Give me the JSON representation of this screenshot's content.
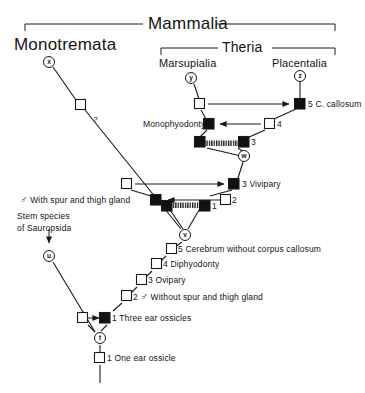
{
  "figure": {
    "type": "cladogram"
  },
  "brackets": [
    {
      "name": "mammalia",
      "label": "Mammalia"
    },
    {
      "name": "theria",
      "label": "Theria"
    }
  ],
  "taxa": [
    {
      "name": "monotremata",
      "label": "Monotremata",
      "node_letter": "x"
    },
    {
      "name": "marsupialia",
      "label": "Marsupialia",
      "node_letter": "y"
    },
    {
      "name": "placentalia",
      "label": "Placentalia",
      "node_letter": "z"
    }
  ],
  "internal_nodes": [
    {
      "letter": "w"
    },
    {
      "letter": "v"
    },
    {
      "letter": "u"
    },
    {
      "letter": "t"
    }
  ],
  "stem_species": {
    "line1": "Stem species",
    "line2": "of  Sauropsida"
  },
  "uncertainty_mark": "?",
  "character_states": {
    "monotremata_branch": {
      "spur_gland": "With spur and thigh gland",
      "spur_gland_symbol": "♂"
    },
    "theria_branch": {
      "monophyodonty": "Monophyodonty",
      "corpus_callosum": "5 C. callosum",
      "state_4": "4",
      "state_3": "3",
      "vivipary": "3 Vivipary",
      "state_2": "2",
      "state_1": "1"
    },
    "ground_plan": [
      {
        "num": "5",
        "text": "Cerebrum without corpus callosum"
      },
      {
        "num": "4",
        "text": "Diphyodonty"
      },
      {
        "num": "3",
        "text": "Ovipary"
      },
      {
        "num": "2",
        "text": "Without spur and thigh gland",
        "symbol": "♂"
      },
      {
        "num": "1",
        "text": "Three ear ossicles"
      }
    ],
    "root_state": {
      "num": "1",
      "text": "One ear ossicle"
    }
  },
  "colors": {
    "line": "#1a1a1a",
    "derived_fill": "#111111",
    "plesiomorphic_fill": "#ffffff",
    "text": "#141414",
    "background": "#ffffff"
  }
}
